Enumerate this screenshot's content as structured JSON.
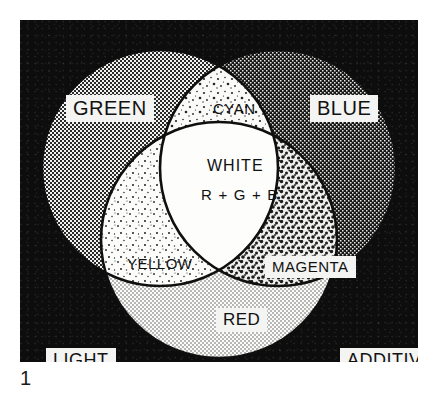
{
  "figure": {
    "caption_number": "1",
    "frame_color": "#0d0d0d",
    "plate": {
      "x": 20,
      "y": 20,
      "width": 398,
      "height": 342
    }
  },
  "diagram": {
    "type": "venn-3-circle",
    "title_implicit": "Additive light color mixing",
    "circles": [
      {
        "name": "green",
        "label": "GREEN",
        "cx": 140,
        "cy": 148,
        "r": 118,
        "fill_pattern": "halftone-medium",
        "fill_color": "#b9b9b9"
      },
      {
        "name": "blue",
        "label": "BLUE",
        "cx": 258,
        "cy": 148,
        "r": 118,
        "fill_pattern": "halftone-dark",
        "fill_color": "#555555"
      },
      {
        "name": "red",
        "label": "RED",
        "cx": 199,
        "cy": 220,
        "r": 118,
        "fill_pattern": "halftone-light",
        "fill_color": "#e4e4e4"
      }
    ],
    "intersections": [
      {
        "name": "cyan",
        "label": "CYAN",
        "of": [
          "green",
          "blue"
        ],
        "fill_pattern": "speckle-light"
      },
      {
        "name": "yellow",
        "label": "YELLOW",
        "of": [
          "green",
          "red"
        ],
        "fill_pattern": "speckle-sparse"
      },
      {
        "name": "magenta",
        "label": "MAGENTA",
        "of": [
          "blue",
          "red"
        ],
        "fill_pattern": "speckle-coarse"
      },
      {
        "name": "white",
        "label": "WHITE",
        "of": [
          "green",
          "blue",
          "red"
        ],
        "fill_pattern": "solid-white"
      }
    ],
    "labels": {
      "green": "GREEN",
      "cyan": "CYAN",
      "blue": "BLUE",
      "white": "WHITE",
      "white_formula": "R + G + B",
      "yellow": "YELLOW",
      "magenta": "MAGENTA",
      "red": "RED",
      "corner_left": "LIGHT",
      "corner_right": "ADDITIVE"
    }
  }
}
